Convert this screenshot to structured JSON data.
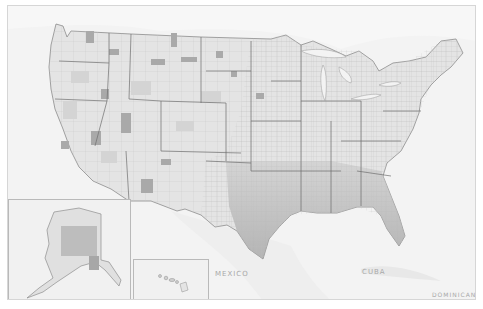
{
  "map": {
    "type": "choropleth",
    "geography": "US counties",
    "palette": "grayscale",
    "colors": {
      "water": "#f3f3f3",
      "land_light": "#ececec",
      "land_mid": "#cfcfcf",
      "land_dark": "#9e9e9e",
      "state_border": "#6f6f6f",
      "county_border": "#bdbdbd",
      "label": "#a8a8a8"
    }
  },
  "labels": {
    "mexico": "MEXICO",
    "cuba": "CUBA",
    "dominican": "DOMINICAN"
  },
  "insets": {
    "alaska": "Alaska inset",
    "hawaii": "Hawaii inset"
  }
}
